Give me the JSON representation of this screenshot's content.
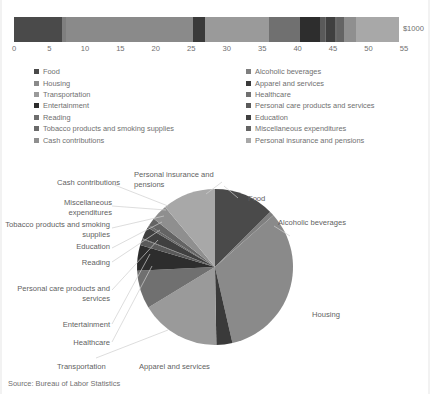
{
  "chart_title": "CONSUMER EXPENDITURES IN THE U.S. BY MAJOR ITEM GROUPS",
  "source_note": "Source: Bureau of Labor Statistics",
  "axis": {
    "unit_label": "$1000",
    "ticks": [
      "0",
      "5",
      "10",
      "15",
      "20",
      "25",
      "30",
      "35",
      "40",
      "45",
      "50",
      "55"
    ],
    "min": 0,
    "max": 55
  },
  "legend": {
    "left_column": [
      {
        "label": "Food",
        "color": "#4a4a4a"
      },
      {
        "label": "Housing",
        "color": "#8a8a8a"
      },
      {
        "label": "Transportation",
        "color": "#9a9a9a"
      },
      {
        "label": "Entertainment",
        "color": "#2d2d2d"
      },
      {
        "label": "Reading",
        "color": "#6e6e6e"
      },
      {
        "label": "Tobacco products and smoking supplies",
        "color": "#6a6a6a"
      },
      {
        "label": "Cash contributions",
        "color": "#8f8f8f"
      }
    ],
    "right_column": [
      {
        "label": "Alcoholic beverages",
        "color": "#7f7f7f"
      },
      {
        "label": "Apparel and services",
        "color": "#3a3a3a"
      },
      {
        "label": "Healthcare",
        "color": "#707070"
      },
      {
        "label": "Personal care products and services",
        "color": "#5a5a5a"
      },
      {
        "label": "Education",
        "color": "#404040"
      },
      {
        "label": "Miscellaneous expenditures",
        "color": "#646464"
      },
      {
        "label": "Personal insurance and pensions",
        "color": "#a8a8a8"
      }
    ]
  },
  "pie_labels": {
    "food": "Food",
    "alcoholic_beverages": "Alcoholic beverages",
    "housing": "Housing",
    "apparel_and_services": "Apparel and services",
    "transportation": "Transportation",
    "healthcare": "Healthcare",
    "entertainment": "Entertainment",
    "personal_care": "Personal care products and services",
    "reading": "Reading",
    "education": "Education",
    "tobacco": "Tobacco products and smoking supplies",
    "miscellaneous": "Miscellaneous expenditures",
    "cash_contributions": "Cash contributions",
    "personal_insurance": "Personal insurance and pensions"
  },
  "chart_data": [
    {
      "type": "bar",
      "orientation": "horizontal",
      "stacked": true,
      "title": "CONSUMER EXPENDITURES IN THE U.S. BY MAJOR ITEM GROUPS",
      "xlabel": "$1000",
      "ylabel": "",
      "xlim": [
        0,
        55
      ],
      "grid": false,
      "xticks": [
        0,
        5,
        10,
        15,
        20,
        25,
        30,
        35,
        40,
        45,
        50,
        55
      ],
      "categories": [
        "All consumer units"
      ],
      "total": 53.5,
      "series": [
        {
          "name": "Food",
          "value": 6.8,
          "color": "#4a4a4a"
        },
        {
          "name": "Alcoholic beverages",
          "value": 0.5,
          "color": "#7f7f7f"
        },
        {
          "name": "Housing",
          "value": 17.9,
          "color": "#8a8a8a"
        },
        {
          "name": "Apparel and services",
          "value": 1.8,
          "color": "#3a3a3a"
        },
        {
          "name": "Transportation",
          "value": 9.0,
          "color": "#9a9a9a"
        },
        {
          "name": "Healthcare",
          "value": 4.3,
          "color": "#707070"
        },
        {
          "name": "Entertainment",
          "value": 2.9,
          "color": "#2d2d2d"
        },
        {
          "name": "Personal care products and services",
          "value": 0.7,
          "color": "#5a5a5a"
        },
        {
          "name": "Reading",
          "value": 0.1,
          "color": "#6e6e6e"
        },
        {
          "name": "Education",
          "value": 1.3,
          "color": "#404040"
        },
        {
          "name": "Tobacco products and smoking supplies",
          "value": 0.3,
          "color": "#6a6a6a"
        },
        {
          "name": "Miscellaneous expenditures",
          "value": 0.9,
          "color": "#646464"
        },
        {
          "name": "Cash contributions",
          "value": 1.8,
          "color": "#8f8f8f"
        },
        {
          "name": "Personal insurance and pensions",
          "value": 6.0,
          "color": "#a8a8a8"
        }
      ]
    },
    {
      "type": "pie",
      "title": "",
      "legend_position": "callout-labels",
      "labels": [
        "Food",
        "Alcoholic beverages",
        "Housing",
        "Apparel and services",
        "Transportation",
        "Healthcare",
        "Entertainment",
        "Personal care products and services",
        "Reading",
        "Education",
        "Tobacco products and smoking supplies",
        "Miscellaneous expenditures",
        "Cash contributions",
        "Personal insurance and pensions"
      ],
      "values": [
        6.8,
        0.5,
        17.9,
        1.8,
        9.0,
        4.3,
        2.9,
        0.7,
        0.1,
        1.3,
        0.3,
        0.9,
        1.8,
        6.0
      ],
      "colors": [
        "#4a4a4a",
        "#7f7f7f",
        "#8a8a8a",
        "#3a3a3a",
        "#9a9a9a",
        "#707070",
        "#2d2d2d",
        "#5a5a5a",
        "#6e6e6e",
        "#404040",
        "#6a6a6a",
        "#646464",
        "#8f8f8f",
        "#a8a8a8"
      ]
    }
  ]
}
